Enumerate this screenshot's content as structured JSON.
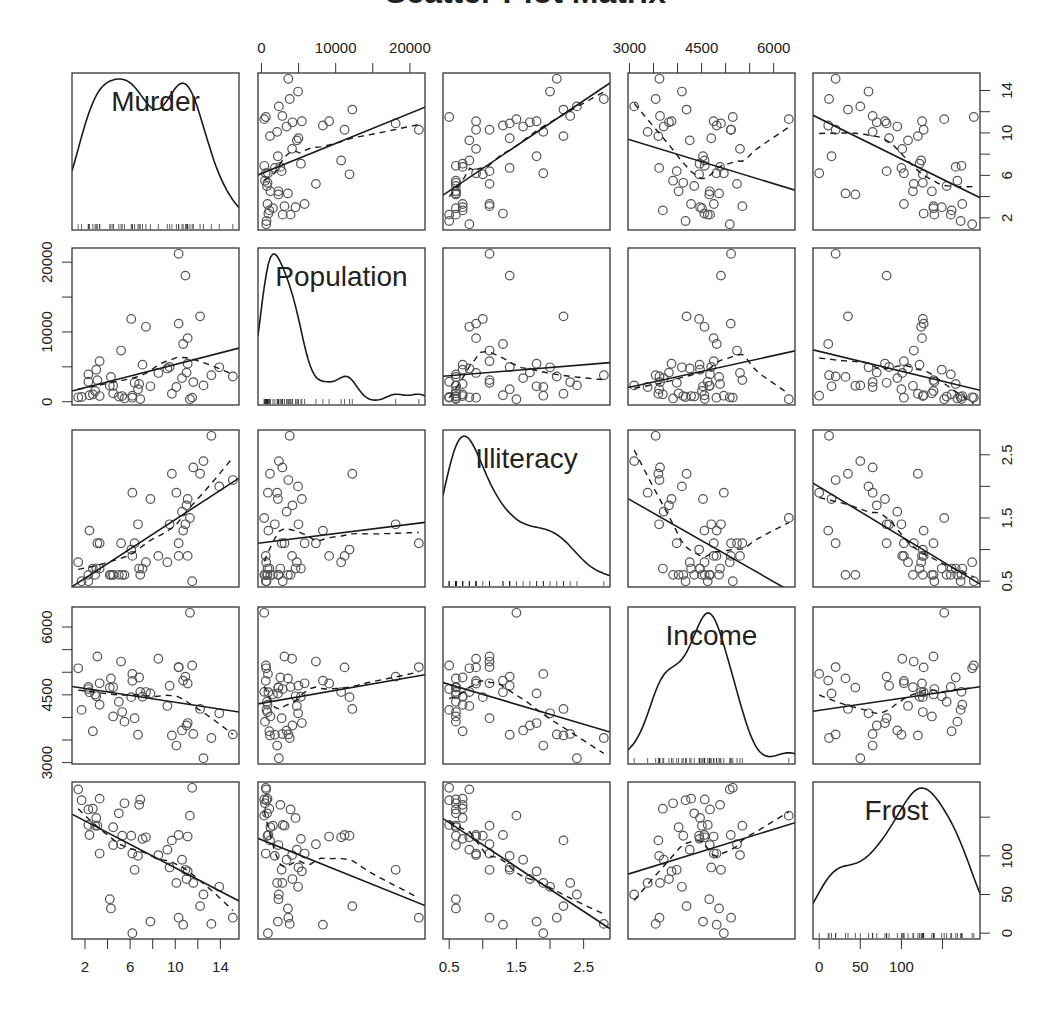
{
  "chart_data": {
    "type": "scatter",
    "subtype": "scatterplot-matrix",
    "title": "Scatter Plot Matrix",
    "variables": [
      "Murder",
      "Population",
      "Illiteracy",
      "Income",
      "Frost"
    ],
    "diagonal": "density with rug",
    "off_diagonal": "scatter with linear fit (solid) and loess smooth (dashed)",
    "ranges": {
      "Murder": [
        1.4,
        15.1
      ],
      "Population": [
        365,
        21198
      ],
      "Illiteracy": [
        0.5,
        2.8
      ],
      "Income": [
        3098,
        6315
      ],
      "Frost": [
        0,
        188
      ]
    },
    "axes": {
      "top": [
        {
          "var": "Population",
          "ticks": [
            0,
            5000,
            10000,
            15000,
            20000
          ],
          "labels": [
            "0",
            "10000",
            "20000"
          ],
          "label_values": [
            0,
            10000,
            20000
          ]
        },
        {
          "var": "Income",
          "ticks": [
            3000,
            3500,
            4000,
            4500,
            5000,
            5500,
            6000
          ],
          "labels": [
            "3000",
            "4500",
            "6000"
          ],
          "label_values": [
            3000,
            4500,
            6000
          ]
        }
      ],
      "bottom": [
        {
          "var": "Murder",
          "ticks": [
            2,
            4,
            6,
            8,
            10,
            12,
            14
          ],
          "labels": [
            "2",
            "6",
            "10",
            "14"
          ],
          "label_values": [
            2,
            6,
            10,
            14
          ]
        },
        {
          "var": "Illiteracy",
          "ticks": [
            0.5,
            1.0,
            1.5,
            2.0,
            2.5
          ],
          "labels": [
            "0.5",
            "1.5",
            "2.5"
          ],
          "label_values": [
            0.5,
            1.5,
            2.5
          ]
        },
        {
          "var": "Frost",
          "ticks": [
            0,
            50,
            100,
            150
          ],
          "labels": [
            "0",
            "50",
            "100"
          ],
          "label_values": [
            0,
            50,
            100
          ]
        }
      ],
      "left": [
        {
          "var": "Population",
          "ticks": [
            0,
            5000,
            10000,
            15000,
            20000
          ],
          "labels": [
            "0",
            "10000",
            "20000"
          ],
          "label_values": [
            0,
            10000,
            20000
          ]
        },
        {
          "var": "Income",
          "ticks": [
            3000,
            3500,
            4000,
            4500,
            5000,
            5500,
            6000
          ],
          "labels": [
            "3000",
            "4500",
            "6000"
          ],
          "label_values": [
            3000,
            4500,
            6000
          ]
        }
      ],
      "right": [
        {
          "var": "Murder",
          "ticks": [
            2,
            4,
            6,
            8,
            10,
            12,
            14
          ],
          "labels": [
            "2",
            "6",
            "10",
            "14"
          ],
          "label_values": [
            2,
            6,
            10,
            14
          ]
        },
        {
          "var": "Illiteracy",
          "ticks": [
            0.5,
            1.0,
            1.5,
            2.0,
            2.5
          ],
          "labels": [
            "0.5",
            "1.5",
            "2.5"
          ],
          "label_values": [
            0.5,
            1.5,
            2.5
          ]
        },
        {
          "var": "Frost",
          "ticks": [
            0,
            50,
            100,
            150
          ],
          "labels": [
            "0",
            "50",
            "100"
          ],
          "label_values": [
            0,
            50,
            100
          ]
        }
      ]
    },
    "data": {
      "Murder": [
        15.1,
        11.3,
        7.8,
        10.1,
        10.3,
        6.8,
        3.1,
        6.2,
        10.7,
        13.9,
        6.2,
        5.3,
        10.3,
        7.1,
        2.3,
        4.5,
        10.6,
        13.2,
        2.7,
        8.5,
        3.3,
        11.1,
        2.3,
        12.5,
        9.3,
        5.0,
        2.9,
        11.5,
        3.3,
        5.2,
        9.7,
        10.9,
        11.1,
        1.4,
        7.4,
        6.4,
        4.2,
        6.1,
        2.4,
        11.6,
        1.7,
        11.0,
        12.2,
        4.5,
        5.5,
        9.5,
        4.3,
        6.7,
        3.0,
        6.9
      ],
      "Population": [
        3615,
        365,
        2212,
        2110,
        21198,
        2541,
        3100,
        579,
        8277,
        4931,
        868,
        813,
        11197,
        5313,
        2861,
        2280,
        3387,
        3806,
        1058,
        4122,
        5814,
        9111,
        3921,
        2341,
        4767,
        746,
        1544,
        590,
        812,
        7333,
        1144,
        18076,
        5441,
        637,
        10735,
        2715,
        2284,
        11860,
        931,
        2816,
        681,
        4173,
        12237,
        1203,
        472,
        4981,
        3559,
        1799,
        4589,
        376
      ],
      "Illiteracy": [
        2.1,
        1.5,
        1.8,
        1.9,
        1.1,
        0.7,
        1.1,
        0.9,
        1.3,
        2.0,
        1.9,
        0.6,
        0.9,
        0.7,
        0.5,
        0.6,
        1.6,
        2.8,
        0.7,
        0.9,
        1.1,
        0.9,
        0.6,
        2.4,
        0.8,
        0.6,
        0.6,
        0.5,
        0.7,
        1.1,
        2.2,
        1.4,
        1.8,
        0.8,
        0.8,
        1.1,
        0.6,
        1.0,
        1.3,
        2.3,
        0.5,
        1.7,
        2.2,
        0.6,
        0.6,
        1.4,
        0.6,
        1.4,
        0.7,
        0.6
      ],
      "Income": [
        3624,
        6315,
        4530,
        3378,
        5114,
        4884,
        5348,
        4809,
        4815,
        4091,
        4963,
        4119,
        5107,
        4458,
        4628,
        4669,
        3712,
        3545,
        3694,
        5299,
        4755,
        4751,
        4675,
        3098,
        4254,
        4347,
        4508,
        5149,
        4281,
        5237,
        3601,
        4903,
        3875,
        5087,
        4561,
        3983,
        4660,
        4449,
        4558,
        3635,
        4167,
        3821,
        4188,
        4022,
        3907,
        4701,
        4864,
        3617,
        4468,
        4566
      ],
      "Frost": [
        20,
        152,
        15,
        65,
        20,
        166,
        139,
        103,
        11,
        60,
        0,
        126,
        127,
        122,
        140,
        114,
        95,
        12,
        161,
        101,
        103,
        125,
        160,
        50,
        108,
        155,
        139,
        188,
        174,
        115,
        120,
        82,
        80,
        186,
        124,
        82,
        44,
        126,
        127,
        65,
        172,
        70,
        35,
        137,
        168,
        85,
        32,
        100,
        149,
        173
      ]
    },
    "diagonal_labels": [
      "Murder",
      "Population",
      "Illiteracy",
      "Income",
      "Frost"
    ]
  },
  "colors": {
    "points": "#555555",
    "lines": "#1a1a1a",
    "frame": "#333333",
    "text": "#222222"
  }
}
